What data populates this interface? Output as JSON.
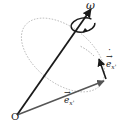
{
  "diagram": {
    "title": "",
    "labels": {
      "omega": "ω",
      "edot_base": "e",
      "edot_sub": "x'",
      "ex_base": "e",
      "ex_sub": "x'",
      "origin": "O"
    },
    "colors": {
      "axis_vector": "#1a1a1a",
      "ex_vector": "#555555",
      "edot_vector": "#1a1a1a",
      "orbit_circle": "#999999",
      "text": "#222222"
    },
    "elements": [
      {
        "id": "omega-vector",
        "from": "O",
        "to": "top",
        "label": "ω"
      },
      {
        "id": "ex-vector",
        "from": "O",
        "to": "tip",
        "label": "e_x'"
      },
      {
        "id": "edot-vector",
        "from": "tip",
        "label": "ė_x'"
      },
      {
        "id": "orbit",
        "type": "dashed-ellipse"
      },
      {
        "id": "rotation-arrow",
        "type": "curved-arrow"
      }
    ]
  }
}
